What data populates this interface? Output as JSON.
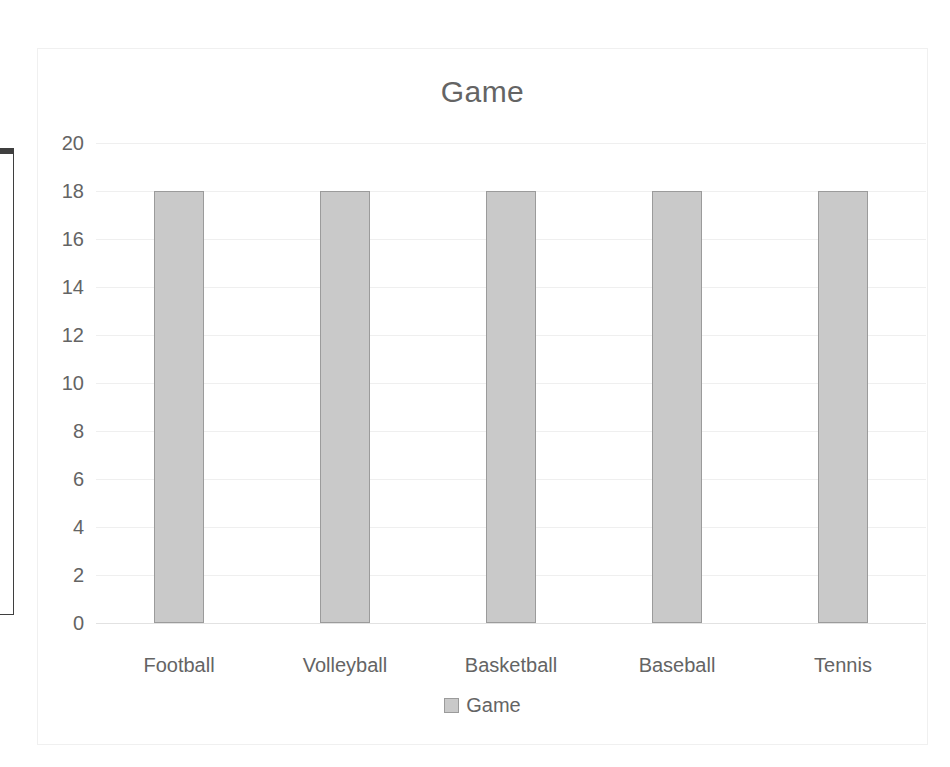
{
  "chart_data": {
    "type": "bar",
    "title": "Game",
    "categories": [
      "Football",
      "Volleyball",
      "Basketball",
      "Baseball",
      "Tennis"
    ],
    "series": [
      {
        "name": "Game",
        "values": [
          18,
          18,
          18,
          18,
          18
        ]
      }
    ],
    "values": [
      18,
      18,
      18,
      18,
      18
    ],
    "xlabel": "",
    "ylabel": "",
    "ylim": [
      0,
      20
    ],
    "ytick_step": 2,
    "yticks": [
      20,
      18,
      16,
      14,
      12,
      10,
      8,
      6,
      4,
      2,
      0
    ],
    "grid": true,
    "legend": {
      "position": "bottom",
      "entries": [
        {
          "label": "Game",
          "swatch": "legend-swatch-game"
        }
      ]
    },
    "colors": {
      "bar_fill": "#c9c9c9",
      "bar_border": "#9b9b9b",
      "text": "#646464",
      "gridline": "#efefef",
      "axis_line": "#e2e2e2",
      "chart_frame": "#f0f0f0",
      "background": "#ffffff"
    }
  },
  "sheet_fragment": {
    "name": "partial-spreadsheet-edge",
    "visible_row_count": 6,
    "border_color": "#3f3f3f"
  }
}
